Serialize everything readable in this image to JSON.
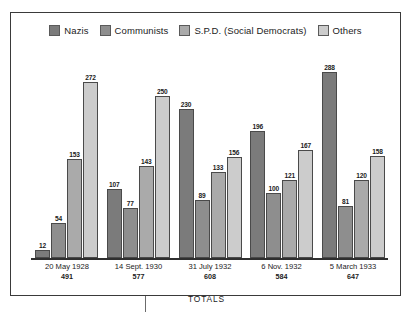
{
  "chart_data": {
    "type": "bar",
    "title": "",
    "subtitle": "",
    "xlabel": "TOTALS",
    "ylabel": "",
    "ylim": [
      0,
      300
    ],
    "grid": false,
    "legend_position": "top-center",
    "categories": [
      "20 May 1928",
      "14 Sept. 1930",
      "31 July 1932",
      "6 Nov. 1932",
      "5 March 1933"
    ],
    "category_totals": [
      491,
      577,
      608,
      584,
      647
    ],
    "series": [
      {
        "name": "Nazis",
        "color": "#7b7b7b",
        "values": [
          12,
          107,
          230,
          196,
          288
        ]
      },
      {
        "name": "Communists",
        "color": "#8e8e8e",
        "values": [
          54,
          77,
          89,
          100,
          81
        ]
      },
      {
        "name": "S.P.D. (Social Democrats)",
        "color": "#aaaaaa",
        "values": [
          153,
          143,
          133,
          121,
          120
        ]
      },
      {
        "name": "Others",
        "color": "#cccccc",
        "values": [
          272,
          250,
          156,
          167,
          158
        ]
      }
    ]
  },
  "legend": {
    "items": [
      {
        "label": "Nazis"
      },
      {
        "label": "Communists"
      },
      {
        "label": "S.P.D. (Social Democrats)"
      },
      {
        "label": "Others"
      }
    ]
  },
  "axis": {
    "totals_caption": "TOTALS"
  },
  "colors": {
    "frame": "#3a3a3a",
    "baseline": "#2f2f2f",
    "text": "#1b1b1b",
    "nazis": "#7b7b7b",
    "communists": "#8e8e8e",
    "spd": "#aaaaaa",
    "others": "#cccccc"
  }
}
